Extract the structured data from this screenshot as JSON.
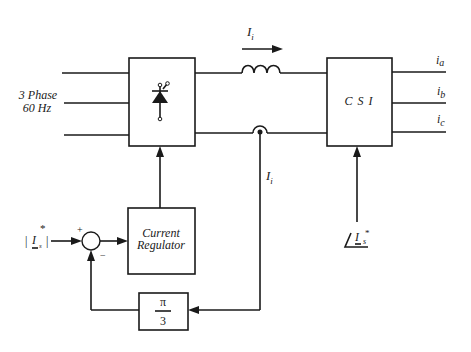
{
  "diagram": {
    "type": "block-diagram",
    "source": {
      "line1": "3 Phase",
      "line2": "60 Hz"
    },
    "blocks": {
      "rectifier": {
        "label": "",
        "symbol": "thyristor-icon"
      },
      "csi": {
        "label": "C S I"
      },
      "regulator": {
        "line1": "Current",
        "line2": "Regulator"
      },
      "gain": {
        "numerator": "π",
        "denominator": "3"
      }
    },
    "signals": {
      "dc_link_current_main": "I",
      "dc_link_current_sub": "i",
      "feedback_current_main": "I",
      "feedback_current_sub": "i",
      "outputs": [
        {
          "main": "i",
          "sub": "a"
        },
        {
          "main": "i",
          "sub": "b"
        },
        {
          "main": "i",
          "sub": "c"
        }
      ],
      "reference_magnitude": {
        "main": "I",
        "sub": "s",
        "sup": "*",
        "prefix": "|",
        "suffix": "|"
      },
      "reference_angle": {
        "main": "I",
        "sub": "s",
        "sup": "*",
        "prefix": "∠"
      }
    },
    "summing_junction": {
      "plus": "+",
      "minus": "−"
    }
  }
}
